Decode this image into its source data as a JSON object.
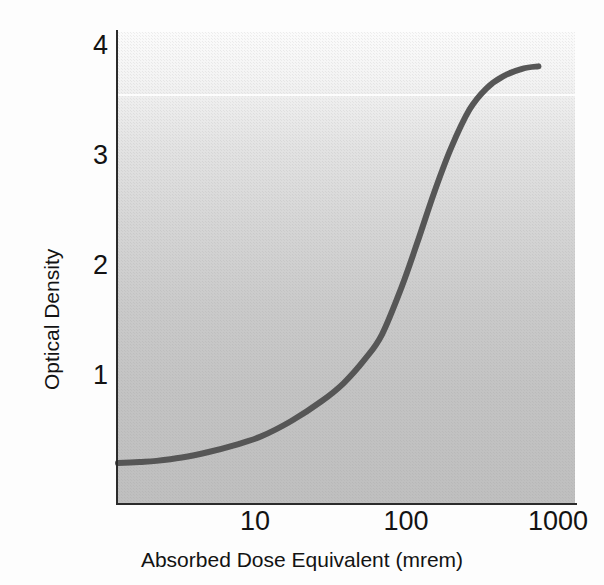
{
  "chart_data": {
    "type": "line",
    "title": "",
    "xlabel": "Absorbed Dose Equivalent (mrem)",
    "ylabel": "Optical Density",
    "xscale": "log",
    "yscale": "linear",
    "xlim": [
      3,
      1300
    ],
    "ylim": [
      0,
      4.25
    ],
    "xticks": [
      10,
      100,
      1000
    ],
    "xtick_labels": [
      "10",
      "100",
      "1000"
    ],
    "yticks": [
      1,
      2,
      3,
      4
    ],
    "ytick_labels": [
      "1",
      "2",
      "3",
      "4"
    ],
    "grid": false,
    "legend": null,
    "series": [
      {
        "name": "Film characteristic curve",
        "color": "#565656",
        "linewidth": 6,
        "x": [
          3,
          4,
          5,
          7,
          10,
          14,
          20,
          30,
          45,
          60,
          80,
          100,
          130,
          160,
          200,
          250,
          320,
          400,
          500,
          650,
          800
        ],
        "y": [
          0.36,
          0.37,
          0.38,
          0.41,
          0.46,
          0.52,
          0.6,
          0.74,
          0.92,
          1.08,
          1.3,
          1.52,
          1.95,
          2.35,
          2.8,
          3.2,
          3.55,
          3.74,
          3.85,
          3.92,
          3.94
        ]
      }
    ],
    "annotations": []
  },
  "axis": {
    "y_labels": [
      "4",
      "3",
      "2",
      "1"
    ],
    "x_labels": [
      "10",
      "100",
      "1000"
    ],
    "y_title": "Optical Density",
    "x_title": "Absorbed Dose Equivalent (mrem)"
  },
  "style": {
    "curve_color": "#565656",
    "axis_color": "#2b2b2b",
    "text_color": "#131313",
    "plot_bg_top": "#fbfbfb",
    "plot_bg_bottom": "#bfbfbf",
    "page_bg": "#ffffff"
  }
}
